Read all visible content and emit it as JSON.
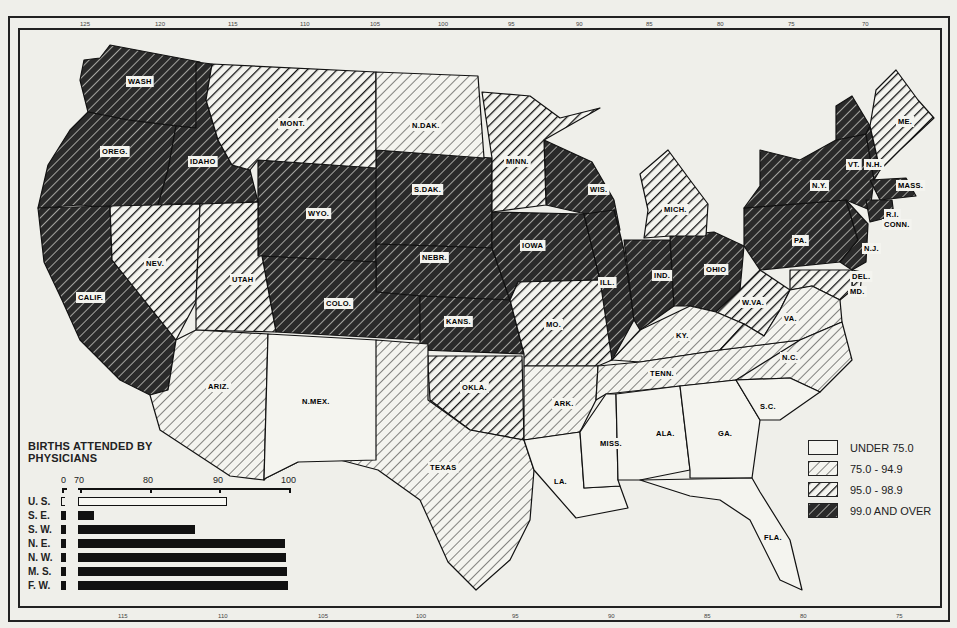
{
  "map": {
    "title": "BIRTHS ATTENDED BY PHYSICIANS",
    "top_ticks": [
      "125",
      "120",
      "115",
      "110",
      "105",
      "100",
      "95",
      "90",
      "85",
      "80",
      "75",
      "70"
    ],
    "bottom_ticks": [
      "115",
      "110",
      "105",
      "100",
      "95",
      "90",
      "85",
      "80",
      "75"
    ],
    "categories": [
      {
        "id": "under75",
        "label": "UNDER 75.0",
        "pattern": "none"
      },
      {
        "id": "c75",
        "label": "75.0 - 94.9",
        "pattern": "light-hatch"
      },
      {
        "id": "c95",
        "label": "95.0 - 98.9",
        "pattern": "medium-hatch"
      },
      {
        "id": "c99",
        "label": "99.0 AND OVER",
        "pattern": "dark-hatch"
      }
    ],
    "states": {
      "wash": {
        "label": "WASH",
        "category": "99.0 AND OVER"
      },
      "oreg": {
        "label": "OREG.",
        "category": "99.0 AND OVER"
      },
      "idaho": {
        "label": "IDAHO",
        "category": "99.0 AND OVER"
      },
      "calif": {
        "label": "CALIF.",
        "category": "99.0 AND OVER"
      },
      "nev": {
        "label": "NEV.",
        "category": "95.0 - 98.9"
      },
      "mont": {
        "label": "MONT.",
        "category": "95.0 - 98.9"
      },
      "wyo": {
        "label": "WYO.",
        "category": "99.0 AND OVER"
      },
      "utah": {
        "label": "UTAH",
        "category": "95.0 - 98.9"
      },
      "colo": {
        "label": "COLO.",
        "category": "99.0 AND OVER"
      },
      "ariz": {
        "label": "ARIZ.",
        "category": "75.0 - 94.9"
      },
      "nmex": {
        "label": "N.MEX.",
        "category": "UNDER 75.0"
      },
      "ndak": {
        "label": "N.DAK.",
        "category": "75.0 - 94.9"
      },
      "sdak": {
        "label": "S.DAK.",
        "category": "99.0 AND OVER"
      },
      "nebr": {
        "label": "NEBR.",
        "category": "99.0 AND OVER"
      },
      "kans": {
        "label": "KANS.",
        "category": "99.0 AND OVER"
      },
      "okla": {
        "label": "OKLA.",
        "category": "95.0 - 98.9"
      },
      "texas": {
        "label": "TEXAS",
        "category": "75.0 - 94.9"
      },
      "minn": {
        "label": "MINN.",
        "category": "95.0 - 98.9"
      },
      "iowa": {
        "label": "IOWA",
        "category": "99.0 AND OVER"
      },
      "mo": {
        "label": "MO.",
        "category": "95.0 - 98.9"
      },
      "ark": {
        "label": "ARK.",
        "category": "75.0 - 94.9"
      },
      "la": {
        "label": "LA.",
        "category": "UNDER 75.0"
      },
      "wis": {
        "label": "WIS.",
        "category": "99.0 AND OVER"
      },
      "ill": {
        "label": "ILL.",
        "category": "99.0 AND OVER"
      },
      "mich": {
        "label": "MICH.",
        "category": "95.0 - 98.9"
      },
      "ind": {
        "label": "IND.",
        "category": "99.0 AND OVER"
      },
      "ohio": {
        "label": "OHIO",
        "category": "99.0 AND OVER"
      },
      "ky": {
        "label": "KY.",
        "category": "75.0 - 94.9"
      },
      "tenn": {
        "label": "TENN.",
        "category": "75.0 - 94.9"
      },
      "miss": {
        "label": "MISS.",
        "category": "UNDER 75.0"
      },
      "ala": {
        "label": "ALA.",
        "category": "UNDER 75.0"
      },
      "ga": {
        "label": "GA.",
        "category": "UNDER 75.0"
      },
      "fla": {
        "label": "FLA.",
        "category": "UNDER 75.0"
      },
      "sc": {
        "label": "S.C.",
        "category": "UNDER 75.0"
      },
      "nc": {
        "label": "N.C.",
        "category": "75.0 - 94.9"
      },
      "va": {
        "label": "VA.",
        "category": "75.0 - 94.9"
      },
      "wva": {
        "label": "W.VA.",
        "category": "95.0 - 98.9"
      },
      "pa": {
        "label": "PA.",
        "category": "99.0 AND OVER"
      },
      "ny": {
        "label": "N.Y.",
        "category": "99.0 AND OVER"
      },
      "vt": {
        "label": "VT.",
        "category": "99.0 AND OVER"
      },
      "nh": {
        "label": "N.H.",
        "category": "99.0 AND OVER"
      },
      "me": {
        "label": "ME.",
        "category": "95.0 - 98.9"
      },
      "mass": {
        "label": "MASS.",
        "category": "99.0 AND OVER"
      },
      "ri": {
        "label": "R.I.",
        "category": "99.0 AND OVER"
      },
      "conn": {
        "label": "CONN.",
        "category": "99.0 AND OVER"
      },
      "nj": {
        "label": "N.J.",
        "category": "99.0 AND OVER"
      },
      "del": {
        "label": "DEL.",
        "category": "95.0 - 98.9"
      },
      "md": {
        "label": "MD.",
        "category": "95.0 - 98.9"
      }
    }
  },
  "legend": {
    "items": [
      {
        "label": "UNDER 75.0"
      },
      {
        "label": "75.0 - 94.9"
      },
      {
        "label": "95.0 - 98.9"
      },
      {
        "label": "99.0 AND OVER"
      }
    ]
  },
  "chart_data": {
    "type": "bar",
    "orientation": "horizontal",
    "title": "BIRTHS ATTENDED BY PHYSICIANS",
    "xlabel": "",
    "ylabel": "",
    "axis_ticks": [
      "0",
      "70",
      "80",
      "90",
      "100"
    ],
    "axis_break": "0 to 70 (broken axis)",
    "xlim": [
      70,
      100
    ],
    "categories": [
      "U. S.",
      "S. E.",
      "S. W.",
      "N. E.",
      "N. W.",
      "M. S.",
      "F. W."
    ],
    "values": [
      91.0,
      71.5,
      86.5,
      99.3,
      99.5,
      99.6,
      99.7
    ],
    "highlight": {
      "U. S.": "outlined bar"
    }
  },
  "chart": {
    "title_line1": "BIRTHS ATTENDED BY",
    "title_line2": "PHYSICIANS",
    "ticks": [
      {
        "label": "0",
        "value": 0
      },
      {
        "label": "70",
        "value": 70
      },
      {
        "label": "80",
        "value": 80
      },
      {
        "label": "90",
        "value": 90
      },
      {
        "label": "100",
        "value": 100
      }
    ],
    "rows": [
      {
        "label": "U. S.",
        "value": 91.0
      },
      {
        "label": "S. E.",
        "value": 71.5
      },
      {
        "label": "S. W.",
        "value": 86.5
      },
      {
        "label": "N. E.",
        "value": 99.3
      },
      {
        "label": "N. W.",
        "value": 99.5
      },
      {
        "label": "M. S.",
        "value": 99.6
      },
      {
        "label": "F. W.",
        "value": 99.7
      }
    ]
  }
}
